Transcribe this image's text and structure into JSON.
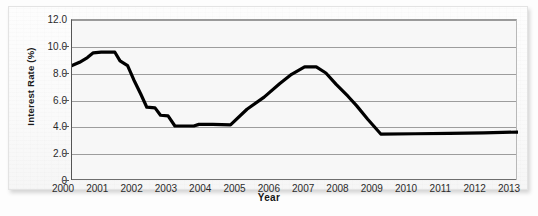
{
  "chart_data": {
    "type": "line",
    "title": "",
    "subtitle": "",
    "xlabel": "Year",
    "ylabel": "Interest Rate (%)",
    "xlim": [
      2000,
      2013
    ],
    "ylim": [
      0,
      12
    ],
    "ytick_labels": [
      "12.0",
      "10.0",
      "8.0",
      "6.0",
      "4.0",
      "2.0",
      "0"
    ],
    "ytick_values": [
      12,
      10,
      8,
      6,
      4,
      2,
      0
    ],
    "xtick_labels": [
      "2000",
      "2001",
      "2002",
      "2003",
      "2004",
      "2005",
      "2006",
      "2007",
      "2008",
      "2009",
      "2010",
      "2011",
      "2012",
      "2013"
    ],
    "xtick_values": [
      2000,
      2001,
      2002,
      2003,
      2004,
      2005,
      2006,
      2007,
      2008,
      2009,
      2010,
      2011,
      2012,
      2013
    ],
    "grid": true,
    "legend": false,
    "legend_position": "none",
    "line_color": "#000000",
    "line_width": 3,
    "series": [
      {
        "name": "Interest Rate",
        "x": [
          2000.0,
          2000.22,
          2000.45,
          2000.62,
          2000.85,
          2001.25,
          2001.4,
          2001.62,
          2001.8,
          2002.0,
          2002.18,
          2002.42,
          2002.58,
          2002.8,
          2003.0,
          2003.55,
          2003.7,
          2004.1,
          2004.62,
          2005.1,
          2005.6,
          2006.05,
          2006.4,
          2006.78,
          2007.12,
          2007.4,
          2007.7,
          2008.05,
          2008.3,
          2008.62,
          2009.0,
          2010.0,
          2011.0,
          2012.0,
          2013.0
        ],
        "y": [
          8.6,
          8.85,
          9.2,
          9.55,
          9.6,
          9.6,
          8.95,
          8.6,
          7.55,
          6.5,
          5.5,
          5.45,
          4.9,
          4.85,
          4.1,
          4.1,
          4.22,
          4.22,
          4.18,
          5.35,
          6.25,
          7.25,
          7.95,
          8.5,
          8.5,
          8.05,
          7.2,
          6.3,
          5.6,
          4.6,
          3.5,
          3.52,
          3.55,
          3.58,
          3.65
        ]
      }
    ]
  },
  "axes": {
    "y_title": "Interest Rate (%)",
    "x_title": "Year"
  }
}
